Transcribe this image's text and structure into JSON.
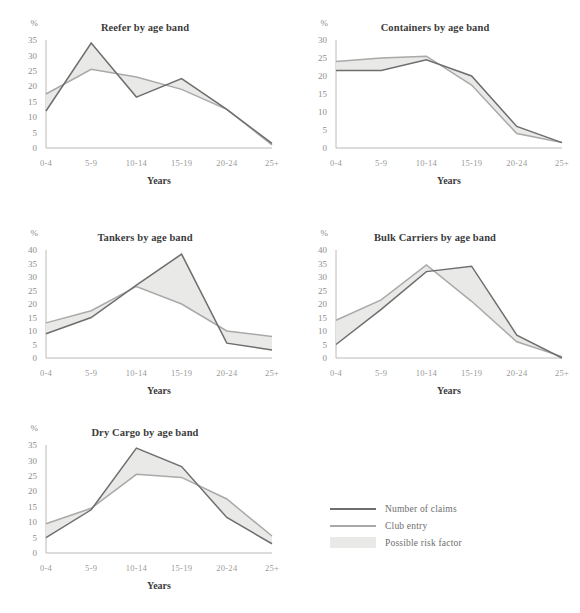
{
  "figure": {
    "background": "#ffffff",
    "claims_color": "#6e6e6e",
    "club_color": "#a9a9a9",
    "area_color": "#e9e9e7",
    "axis_color": "#a8a8a8",
    "percent_symbol": "%",
    "xlabel": "Years",
    "categories": [
      "0-4",
      "5-9",
      "10-14",
      "15-19",
      "20-24",
      "25+"
    ]
  },
  "legend": {
    "position": "bottom-right",
    "items": [
      {
        "label": "Number of claims",
        "type": "line",
        "color": "#6e6e6e"
      },
      {
        "label": "Club entry",
        "type": "line",
        "color": "#a9a9a9"
      },
      {
        "label": "Possible risk factor",
        "type": "area",
        "color": "#e9e9e7"
      }
    ]
  },
  "chart_data": [
    {
      "id": "reefer",
      "type": "line",
      "title": "Reefer by age band",
      "xlabel": "Years",
      "ylabel": "%",
      "categories": [
        "0-4",
        "5-9",
        "10-14",
        "15-19",
        "20-24",
        "25+"
      ],
      "yticks": [
        0,
        5,
        10,
        15,
        20,
        25,
        30,
        35
      ],
      "ylim": [
        0,
        35
      ],
      "grid": false,
      "series": [
        {
          "name": "Number of claims",
          "values": [
            12,
            34,
            16.5,
            22.5,
            12.5,
            1.5
          ]
        },
        {
          "name": "Club entry",
          "values": [
            17.5,
            25.5,
            23,
            19,
            12.5,
            1
          ]
        }
      ]
    },
    {
      "id": "containers",
      "type": "line",
      "title": "Containers by age band",
      "xlabel": "Years",
      "ylabel": "%",
      "categories": [
        "0-4",
        "5-9",
        "10-14",
        "15-19",
        "20-24",
        "25+"
      ],
      "yticks": [
        0,
        5,
        10,
        15,
        20,
        25,
        30
      ],
      "ylim": [
        0,
        30
      ],
      "grid": false,
      "series": [
        {
          "name": "Number of claims",
          "values": [
            21.5,
            21.5,
            24.5,
            20,
            6,
            1.5
          ]
        },
        {
          "name": "Club entry",
          "values": [
            24,
            25,
            25.5,
            17.5,
            4,
            1.5
          ]
        }
      ]
    },
    {
      "id": "tankers",
      "type": "line",
      "title": "Tankers by age band",
      "xlabel": "Years",
      "ylabel": "%",
      "categories": [
        "0-4",
        "5-9",
        "10-14",
        "15-19",
        "20-24",
        "25+"
      ],
      "yticks": [
        0,
        5,
        10,
        15,
        20,
        25,
        30,
        35,
        40
      ],
      "ylim": [
        0,
        40
      ],
      "grid": false,
      "series": [
        {
          "name": "Number of claims",
          "values": [
            9,
            15,
            27,
            38.5,
            5.5,
            3
          ]
        },
        {
          "name": "Club entry",
          "values": [
            13,
            17.5,
            26.5,
            20,
            10,
            8
          ]
        }
      ]
    },
    {
      "id": "bulk-carriers",
      "type": "line",
      "title": "Bulk Carriers by age band",
      "xlabel": "Years",
      "ylabel": "%",
      "categories": [
        "0-4",
        "5-9",
        "10-14",
        "15-19",
        "20-24",
        "25+"
      ],
      "yticks": [
        0,
        5,
        10,
        15,
        20,
        25,
        30,
        35,
        40
      ],
      "ylim": [
        0,
        40
      ],
      "grid": false,
      "series": [
        {
          "name": "Number of claims",
          "values": [
            5,
            18,
            32,
            34,
            8.5,
            0
          ]
        },
        {
          "name": "Club entry",
          "values": [
            14,
            21.5,
            34.5,
            21,
            6,
            0.5
          ]
        }
      ]
    },
    {
      "id": "dry-cargo",
      "type": "line",
      "title": "Dry Cargo by age band",
      "xlabel": "Years",
      "ylabel": "%",
      "categories": [
        "0-4",
        "5-9",
        "10-14",
        "15-19",
        "20-24",
        "25+"
      ],
      "yticks": [
        0,
        5,
        10,
        15,
        20,
        25,
        30,
        35
      ],
      "ylim": [
        0,
        35
      ],
      "grid": false,
      "series": [
        {
          "name": "Number of claims",
          "values": [
            5,
            14,
            34,
            28,
            11.5,
            3
          ]
        },
        {
          "name": "Club entry",
          "values": [
            9.5,
            14.5,
            25.5,
            24.5,
            17.5,
            5.5
          ]
        }
      ]
    }
  ]
}
